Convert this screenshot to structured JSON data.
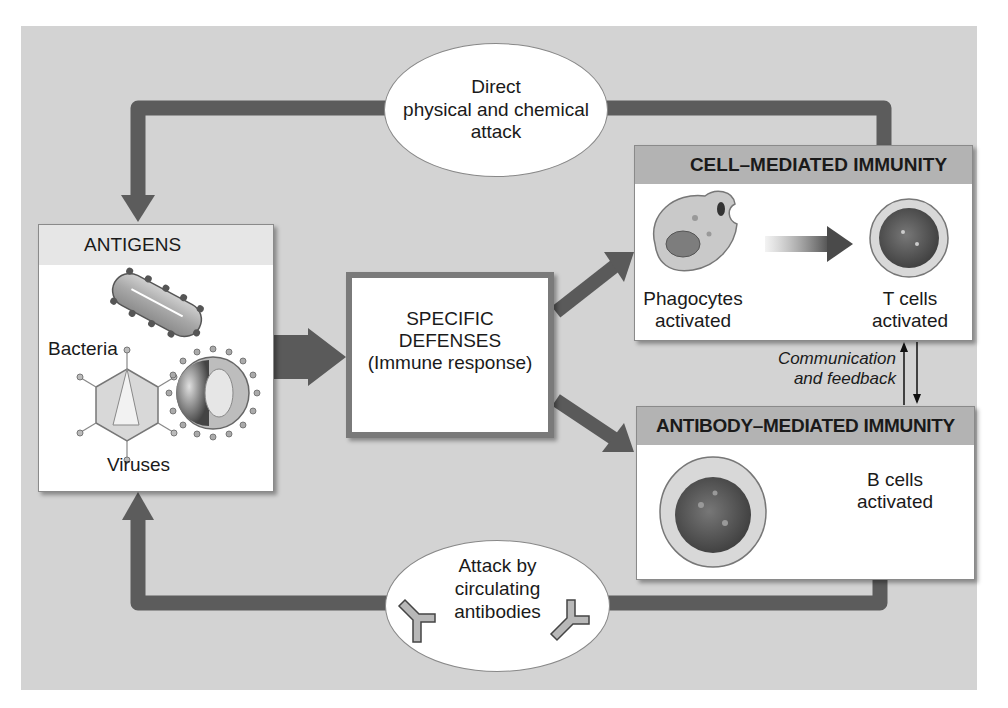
{
  "diagram": {
    "top_ellipse": {
      "lines": [
        "Direct",
        "physical and chemical",
        "attack"
      ]
    },
    "bottom_ellipse": {
      "lines": [
        "Attack by",
        "circulating",
        "antibodies"
      ]
    },
    "antigens": {
      "title": "ANTIGENS",
      "bacteria_label": "Bacteria",
      "viruses_label": "Viruses"
    },
    "specific_defenses": {
      "lines": [
        "SPECIFIC",
        "DEFENSES",
        "(Immune response)"
      ]
    },
    "cell_mediated": {
      "title": "CELL–MEDIATED IMMUNITY",
      "phagocytes_lines": [
        "Phagocytes",
        "activated"
      ],
      "tcells_lines": [
        "T cells",
        "activated"
      ]
    },
    "communication": {
      "lines": [
        "Communication",
        "and feedback"
      ]
    },
    "antibody_mediated": {
      "title": "ANTIBODY–MEDIATED IMMUNITY",
      "bcells_lines": [
        "B cells",
        "activated"
      ]
    },
    "colors": {
      "background_panel": "#d3d3d3",
      "arrow": "#5a5a5a",
      "box_header": "#b3b3b3",
      "box_body": "#ffffff"
    }
  }
}
